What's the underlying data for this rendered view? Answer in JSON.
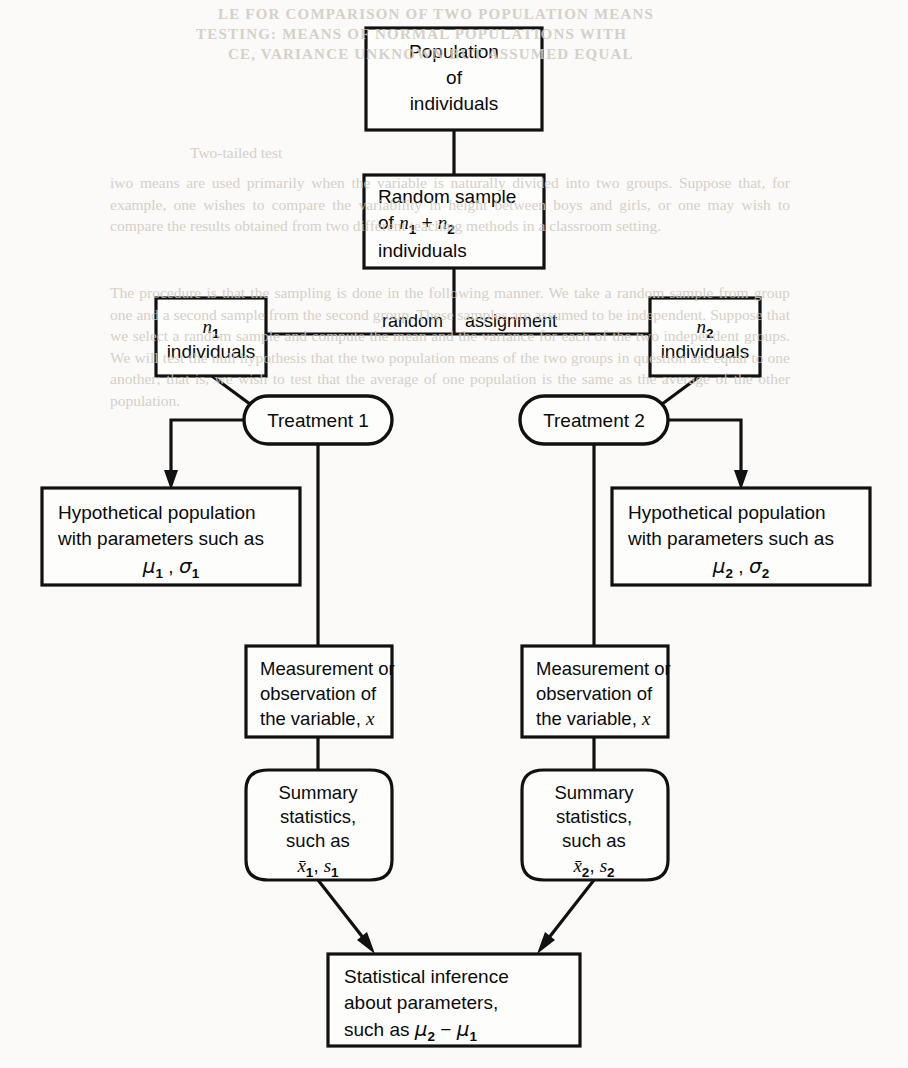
{
  "figure": {
    "type": "flowchart",
    "nodes": {
      "population": {
        "shape": "rectangle",
        "lines": [
          "Population",
          "of",
          "individuals"
        ],
        "align": "center"
      },
      "random_sample": {
        "shape": "rectangle",
        "lines": [
          "Random sample",
          "of n₁ + n₂",
          "individuals"
        ],
        "line1": "Random sample",
        "line2_prefix": "of ",
        "line2_n1": "n",
        "line2_n1_sub": "1",
        "line2_plus": " + ",
        "line2_n2": "n",
        "line2_n2_sub": "2",
        "line3": "individuals",
        "align": "left"
      },
      "group1": {
        "shape": "rectangle",
        "symbol": "n",
        "subscript": "1",
        "label": "individuals",
        "align": "center"
      },
      "group2": {
        "shape": "rectangle",
        "symbol": "n",
        "subscript": "2",
        "label": "individuals",
        "align": "center"
      },
      "treatment1": {
        "shape": "stadium",
        "label": "Treatment 1"
      },
      "treatment2": {
        "shape": "stadium",
        "label": "Treatment 2"
      },
      "hypothetical_population1": {
        "shape": "rectangle",
        "line1": "Hypothetical population",
        "line2": "with parameters such as",
        "mu": "μ",
        "mu_sub": "1",
        "comma": " , ",
        "sigma": "σ",
        "sigma_sub": "1"
      },
      "hypothetical_population2": {
        "shape": "rectangle",
        "line1": "Hypothetical population",
        "line2": "with parameters such as",
        "mu": "μ",
        "mu_sub": "2",
        "comma": " , ",
        "sigma": "σ",
        "sigma_sub": "2"
      },
      "measurement1": {
        "shape": "rectangle",
        "line1": "Measurement or",
        "line2": "observation of",
        "line3_prefix": "the variable, ",
        "line3_var": "x"
      },
      "measurement2": {
        "shape": "rectangle",
        "line1": "Measurement or",
        "line2": "observation of",
        "line3_prefix": "the variable, ",
        "line3_var": "x"
      },
      "summary1": {
        "shape": "barrel",
        "line1": "Summary",
        "line2": "statistics,",
        "line3": "such as",
        "xbar": "x̅",
        "xbar_sub": "1",
        "sep": ", ",
        "s": "s",
        "s_sub": "1"
      },
      "summary2": {
        "shape": "barrel",
        "line1": "Summary",
        "line2": "statistics,",
        "line3": "such as",
        "xbar": "x̅",
        "xbar_sub": "2",
        "sep": ", ",
        "s": "s",
        "s_sub": "2"
      },
      "inference": {
        "shape": "rectangle",
        "line1": "Statistical inference",
        "line2": "about parameters,",
        "line3_prefix": "such as ",
        "mu2": "μ",
        "mu2_sub": "2",
        "minus": " − ",
        "mu1": "μ",
        "mu1_sub": "1"
      }
    },
    "edge_labels": {
      "random_assignment_left": "random",
      "random_assignment_right": "assignment"
    },
    "colors": {
      "stroke": "#111111",
      "node_fill": "#fdfdfb",
      "page_background": "#fbfaf8",
      "text": "#0b0b0b",
      "bleed_text": "#cfc9c0"
    }
  },
  "bleed_through": {
    "header_line1": "LE FOR COMPARISON OF TWO POPULATION MEANS",
    "header_line2": "TESTING: MEANS OF NORMAL POPULATIONS WITH",
    "header_line3": "CE, VARIANCE UNKNOWN BUT ASSUMED EQUAL",
    "section_label": "Two-tailed test",
    "paragraph1": "iwo means are used primarily when the variable is naturally divided into two groups. Suppose that, for example, one wishes to compare the variability in height between boys and girls, or one may wish to compare the results obtained from two different teaching methods in a classroom setting.",
    "paragraph2": "The procedure is that the sampling is done in the following manner. We take a random sample from group one and a second sample from the second group. These samples are assumed to be independent. Suppose that we select a random sample and compute the mean and the variance for each of the two independent groups. We will test the null hypothesis that the two population means of the two groups in question are equal to one another; that is, we wish to test that the average of one population is the same as the average of the other population."
  }
}
